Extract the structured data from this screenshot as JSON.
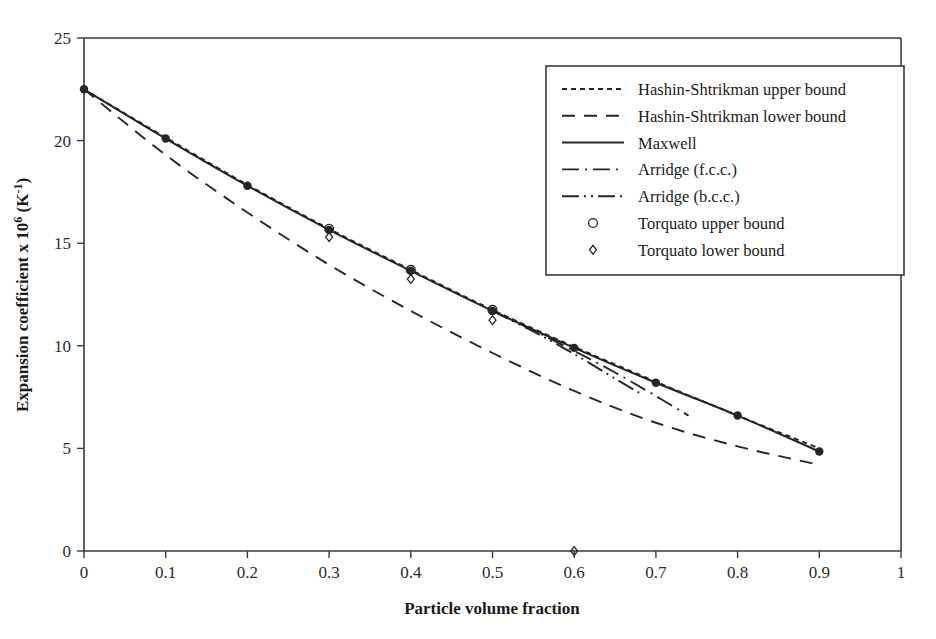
{
  "chart_data": {
    "type": "line",
    "title": "",
    "xlabel": "Particle volume fraction",
    "ylabel": "Expansion coefficient x 10⁶ (K⁻¹)",
    "xlim": [
      0,
      1
    ],
    "ylim": [
      0,
      25
    ],
    "xticks": [
      0,
      0.1,
      0.2,
      0.3,
      0.4,
      0.5,
      0.6,
      0.7,
      0.8,
      0.9,
      1
    ],
    "xticklabels": [
      "0",
      "0.1",
      "0.2",
      "0.3",
      "0.4",
      "0.5",
      "0.6",
      "0.7",
      "0.8",
      "0.9",
      "1"
    ],
    "yticks": [
      0,
      5,
      10,
      15,
      20,
      25
    ],
    "yticklabels": [
      "0",
      "5",
      "10",
      "15",
      "20",
      "25"
    ],
    "grid": false,
    "legend_position": "upper-right",
    "series": [
      {
        "name": "Hashin-Shtrikman upper bound",
        "style": "dotted",
        "marker": "none",
        "x": [
          0,
          0.1,
          0.2,
          0.3,
          0.4,
          0.5,
          0.6,
          0.7,
          0.8,
          0.9
        ],
        "values": [
          22.5,
          20.15,
          17.85,
          15.7,
          13.7,
          11.75,
          9.95,
          8.25,
          6.6,
          5.0
        ]
      },
      {
        "name": "Hashin-Shtrikman lower bound",
        "style": "dashed",
        "marker": "none",
        "x": [
          0,
          0.1,
          0.2,
          0.3,
          0.4,
          0.5,
          0.6,
          0.7,
          0.8,
          0.9
        ],
        "values": [
          22.5,
          19.3,
          16.5,
          13.95,
          11.7,
          9.65,
          7.8,
          6.25,
          5.1,
          4.2
        ]
      },
      {
        "name": "Maxwell",
        "style": "solid",
        "marker": "filled-circle",
        "x": [
          0,
          0.1,
          0.2,
          0.3,
          0.4,
          0.5,
          0.6,
          0.7,
          0.8,
          0.9
        ],
        "values": [
          22.5,
          20.1,
          17.8,
          15.65,
          13.65,
          11.7,
          9.9,
          8.2,
          6.6,
          4.85
        ]
      },
      {
        "name": "Arridge (f.c.c.)",
        "style": "dash-dot",
        "marker": "none",
        "x": [
          0.5,
          0.55,
          0.6,
          0.65,
          0.7,
          0.74
        ],
        "values": [
          11.7,
          10.75,
          9.75,
          8.7,
          7.55,
          6.6
        ]
      },
      {
        "name": "Arridge (b.c.c.)",
        "style": "dash-dot-dot",
        "marker": "none",
        "x": [
          0.5,
          0.55,
          0.6,
          0.65,
          0.68
        ],
        "values": [
          11.7,
          10.7,
          9.6,
          8.4,
          7.7
        ]
      },
      {
        "name": "Torquato upper bound",
        "style": "none",
        "marker": "open-circle",
        "x": [
          0.3,
          0.4,
          0.5
        ],
        "values": [
          15.7,
          13.7,
          11.75
        ]
      },
      {
        "name": "Torquato lower bound",
        "style": "none",
        "marker": "open-diamond",
        "x": [
          0.3,
          0.4,
          0.5,
          0.6
        ],
        "values": [
          15.3,
          13.25,
          11.25,
          0.0
        ]
      }
    ]
  },
  "legend": {
    "items": [
      {
        "label": "Hashin-Shtrikman upper bound",
        "kind": "line",
        "style": "dotted"
      },
      {
        "label": "Hashin-Shtrikman lower bound",
        "kind": "line",
        "style": "dashed"
      },
      {
        "label": "Maxwell",
        "kind": "line",
        "style": "solid"
      },
      {
        "label": "Arridge (f.c.c.)",
        "kind": "line",
        "style": "dash-dot"
      },
      {
        "label": "Arridge (b.c.c.)",
        "kind": "line",
        "style": "dash-dot-dot"
      },
      {
        "label": "Torquato  upper bound",
        "kind": "marker",
        "style": "open-circle"
      },
      {
        "label": "Torquato lower bound",
        "kind": "marker",
        "style": "open-diamond"
      }
    ]
  },
  "axes": {
    "x_title": "Particle volume fraction",
    "y_title": "Expansion coefficient x 10⁶ (K⁻¹)",
    "y_title_parts": {
      "main": "Expansion coefficient x 10",
      "exp": "6",
      "unit_open": " (K",
      "unit_exp": "-1",
      "unit_close": ")"
    }
  },
  "colors": {
    "line": "#262626",
    "frame": "#3a3a3a",
    "text": "#1a1a1a",
    "background": "#ffffff"
  }
}
